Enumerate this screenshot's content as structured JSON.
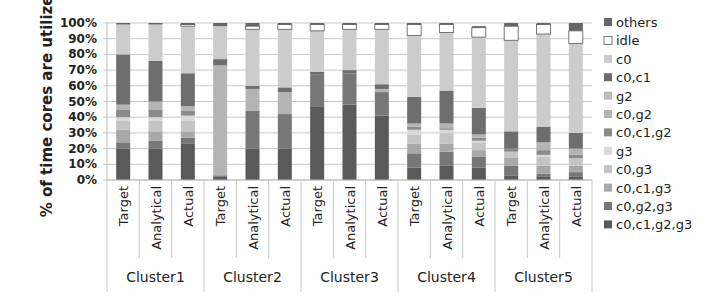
{
  "chart_data": {
    "type": "bar",
    "stacked": true,
    "title": "",
    "xlabel": "",
    "ylabel": "% of time cores are utilized",
    "ylim": [
      0,
      100
    ],
    "yticks": [
      "0%",
      "10%",
      "20%",
      "30%",
      "40%",
      "50%",
      "60%",
      "70%",
      "80%",
      "90%",
      "100%"
    ],
    "grid": true,
    "legend_position": "right",
    "groups": [
      "Cluster1",
      "Cluster2",
      "Cluster3",
      "Cluster4",
      "Cluster5"
    ],
    "categories": [
      "Target",
      "Analytical",
      "Actual",
      "Target",
      "Analytical",
      "Actual",
      "Target",
      "Analytical",
      "Actual",
      "Target",
      "Analytical",
      "Actual",
      "Target",
      "Analytical",
      "Actual"
    ],
    "legend": [
      "others",
      "idle",
      "c0",
      "c0,c1",
      "g2",
      "c0,g2",
      "c0,c1,g2",
      "g3",
      "c0,g3",
      "c0,c1,g3",
      "c0,g2,g3",
      "c0,c1,g2,g3"
    ],
    "series": [
      {
        "name": "c0,c1,g2,g3",
        "color": "#5a5a5a",
        "values": [
          20,
          20,
          23,
          2,
          20,
          20,
          47,
          48,
          41,
          8,
          9,
          8,
          3,
          2,
          2
        ]
      },
      {
        "name": "c0,g2,g3",
        "color": "#777777",
        "values": [
          4,
          5,
          4,
          1,
          24,
          22,
          20,
          20,
          15,
          9,
          9,
          7,
          6,
          2,
          3
        ]
      },
      {
        "name": "c0,c1,g3",
        "color": "#a8a8a8",
        "values": [
          8,
          6,
          4,
          0,
          0,
          0,
          0,
          0,
          0,
          6,
          5,
          4,
          5,
          5,
          4
        ]
      },
      {
        "name": "c0,g3",
        "color": "#c4c4c4",
        "values": [
          6,
          7,
          7,
          0,
          0,
          0,
          0,
          0,
          0,
          6,
          7,
          5,
          4,
          6,
          5
        ]
      },
      {
        "name": "g3",
        "color": "#d8d8d8",
        "values": [
          2,
          2,
          3,
          0,
          0,
          0,
          0,
          0,
          0,
          3,
          2,
          1,
          0,
          1,
          0
        ]
      },
      {
        "name": "c0,c1,g2",
        "color": "#8a8a8a",
        "values": [
          5,
          5,
          3,
          0,
          0,
          0,
          0,
          0,
          0,
          2,
          1,
          2,
          2,
          3,
          2
        ]
      },
      {
        "name": "c0,g2",
        "color": "#b4b4b4",
        "values": [
          3,
          5,
          3,
          70,
          14,
          14,
          0,
          0,
          2,
          2,
          3,
          2,
          0,
          5,
          4
        ]
      },
      {
        "name": "g2",
        "color": "#bcbcbc",
        "values": [
          0,
          0,
          0,
          0,
          0,
          0,
          0,
          0,
          0,
          0,
          0,
          0,
          0,
          0,
          0
        ]
      },
      {
        "name": "c0,c1",
        "color": "#6e6e6e",
        "values": [
          32,
          26,
          21,
          4,
          2,
          3,
          2,
          2,
          3,
          17,
          21,
          17,
          11,
          10,
          10
        ]
      },
      {
        "name": "c0",
        "color": "#cccccc",
        "values": [
          19,
          23,
          30,
          21,
          36,
          37,
          26,
          26,
          35,
          39,
          37,
          45,
          58,
          59,
          57
        ]
      },
      {
        "name": "idle",
        "color": "#ffffff",
        "values": [
          0,
          0,
          1,
          0,
          2,
          3,
          4,
          3,
          3,
          7,
          5,
          6,
          9,
          6,
          8
        ]
      },
      {
        "name": "others",
        "color": "#666666",
        "values": [
          1,
          1,
          1,
          2,
          2,
          1,
          1,
          1,
          1,
          1,
          1,
          1,
          2,
          1,
          5
        ]
      }
    ]
  }
}
